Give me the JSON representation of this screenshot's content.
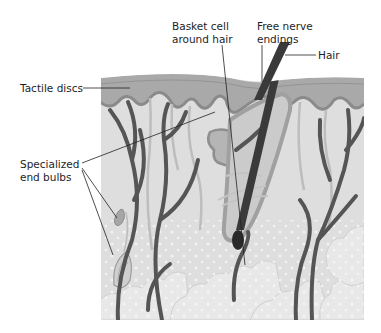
{
  "figure": {
    "colors": {
      "background": "#ffffff",
      "epidermis": "#a8a8a8",
      "epidermis_top": "#bdbdbd",
      "basal_layer": "#8f8f8f",
      "dermis": "#dcdcdc",
      "fat": "#e6e6e6",
      "fat_dots": "#f6f6f6",
      "nerve": "#555555",
      "light_nerve": "#b9b9b9",
      "hair": "#3a3a3a",
      "leader_line": "#222222"
    }
  },
  "labels": {
    "tactile_discs": "Tactile discs",
    "specialized_end_bulbs_line1": "Specialized",
    "specialized_end_bulbs_line2": "end bulbs",
    "basket_cell_line1": "Basket cell",
    "basket_cell_line2": "around hair",
    "free_nerve_line1": "Free nerve",
    "free_nerve_line2": "endings",
    "hair": "Hair"
  }
}
